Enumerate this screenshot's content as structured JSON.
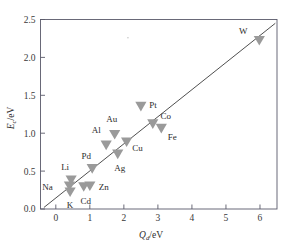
{
  "chart_data": {
    "type": "scatter",
    "title": "",
    "xlabel": "Q_d/eV",
    "ylabel": "E_c/eV",
    "xlabel_main": "Q",
    "xlabel_sub": "d",
    "xlabel_unit": "/eV",
    "ylabel_main": "E",
    "ylabel_sub": "c",
    "ylabel_unit": "/eV",
    "xlim": [
      -0.45,
      6.5
    ],
    "ylim": [
      0.0,
      2.5
    ],
    "xticks": [
      "0",
      "1",
      "2",
      "3",
      "4",
      "5",
      "6"
    ],
    "xtick_values": [
      0,
      1,
      2,
      3,
      4,
      5,
      6
    ],
    "yticks": [
      "0.0",
      "0.5",
      "1.0",
      "1.5",
      "2.0",
      "2.5"
    ],
    "ytick_values": [
      0.0,
      0.5,
      1.0,
      1.5,
      2.0,
      2.5
    ],
    "grid": false,
    "legend": "none",
    "marker_shape": "triangle-down",
    "marker_color": "#9a9a9a",
    "line_color": "#3b3b3b",
    "frame_color": "#5a5a6a",
    "fit_line": {
      "label": "linear fit",
      "x_start": -0.35,
      "y_start": 0.02,
      "x_end": 6.45,
      "y_end": 2.45
    },
    "points": [
      {
        "label": "Na",
        "x": 0.4,
        "y": 0.3,
        "label_dx": -22,
        "label_dy": 4
      },
      {
        "label": "Li",
        "x": 0.45,
        "y": 0.38,
        "label_dx": -6,
        "label_dy": -10
      },
      {
        "label": "K",
        "x": 0.42,
        "y": 0.22,
        "label_dx": 0,
        "label_dy": 16
      },
      {
        "label": "Cd",
        "x": 0.82,
        "y": 0.29,
        "label_dx": 2,
        "label_dy": 17
      },
      {
        "label": "Zn",
        "x": 1.0,
        "y": 0.3,
        "label_dx": 14,
        "label_dy": 4
      },
      {
        "label": "Pd",
        "x": 1.07,
        "y": 0.53,
        "label_dx": -6,
        "label_dy": -10
      },
      {
        "label": "Al",
        "x": 1.48,
        "y": 0.84,
        "label_dx": -10,
        "label_dy": -12
      },
      {
        "label": "Au",
        "x": 1.73,
        "y": 0.98,
        "label_dx": -3,
        "label_dy": -13
      },
      {
        "label": "Ag",
        "x": 1.82,
        "y": 0.72,
        "label_dx": 2,
        "label_dy": 17
      },
      {
        "label": "Cu",
        "x": 2.08,
        "y": 0.88,
        "label_dx": 11,
        "label_dy": 9
      },
      {
        "label": "Pt",
        "x": 2.5,
        "y": 1.35,
        "label_dx": 12,
        "label_dy": 1
      },
      {
        "label": "Co",
        "x": 2.85,
        "y": 1.12,
        "label_dx": 13,
        "label_dy": -5
      },
      {
        "label": "Fe",
        "x": 3.1,
        "y": 1.06,
        "label_dx": 11,
        "label_dy": 11
      },
      {
        "label": "W",
        "x": 5.98,
        "y": 2.22,
        "label_dx": -16,
        "label_dy": -7
      }
    ],
    "stray_specks": [
      {
        "x": 2.12,
        "y": 2.26
      }
    ]
  }
}
